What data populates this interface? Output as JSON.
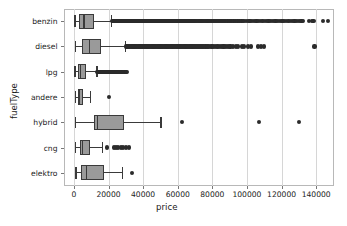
{
  "chart_data": {
    "type": "box",
    "orientation": "horizontal",
    "title": "",
    "xlabel": "price",
    "ylabel": "fuelType",
    "xlim": [
      -6000,
      150000
    ],
    "xticks": [
      0,
      20000,
      40000,
      60000,
      80000,
      100000,
      120000,
      140000
    ],
    "xticklabels": [
      "0",
      "20000",
      "40000",
      "60000",
      "80000",
      "100000",
      "120000",
      "140000"
    ],
    "categories": [
      "benzin",
      "diesel",
      "lpg",
      "andere",
      "hybrid",
      "cng",
      "elektro"
    ],
    "grid": true,
    "grid_axis": "x",
    "legend": null,
    "box_facecolor": "#9a9a9a",
    "box_edgecolor": "#3a3a3a",
    "flier_color": "#2b2b2b",
    "boxes": [
      {
        "category": "benzin",
        "whisker_low": 300,
        "q1": 3000,
        "median": 5900,
        "q3": 11500,
        "whisker_high": 21500,
        "fliers": [
          22000,
          22500,
          23000,
          23400,
          23800,
          24200,
          24600,
          25000,
          25400,
          25800,
          26200,
          26600,
          27000,
          27400,
          27800,
          28200,
          28600,
          29000,
          29400,
          29800,
          30200,
          30600,
          31000,
          31400,
          31800,
          32200,
          32600,
          33000,
          33400,
          33800,
          34200,
          34600,
          35000,
          35400,
          35800,
          36200,
          36600,
          37000,
          37400,
          37800,
          38200,
          38600,
          39000,
          39400,
          39800,
          40200,
          40600,
          41000,
          41400,
          41800,
          42200,
          42600,
          43000,
          43400,
          43800,
          44200,
          44600,
          45000,
          45400,
          45800,
          46200,
          46600,
          47000,
          47400,
          47800,
          48200,
          48600,
          49000,
          49400,
          49800,
          50200,
          50600,
          51000,
          51400,
          51800,
          52200,
          52600,
          53000,
          53400,
          53800,
          54200,
          54600,
          55000,
          55400,
          55800,
          56200,
          56600,
          57000,
          57400,
          57800,
          58200,
          58600,
          59000,
          59400,
          59800,
          60200,
          60600,
          61000,
          61400,
          61800,
          62200,
          62600,
          63000,
          63400,
          63800,
          64200,
          64600,
          65000,
          65400,
          65800,
          66200,
          66600,
          67000,
          67400,
          67800,
          68200,
          68600,
          69000,
          69400,
          69800,
          70200,
          70700,
          71200,
          71700,
          72200,
          72700,
          73200,
          73700,
          74200,
          74700,
          75200,
          75700,
          76200,
          76700,
          77200,
          77700,
          78200,
          78700,
          79200,
          79700,
          80200,
          80800,
          81400,
          82000,
          82600,
          83200,
          83800,
          84400,
          85000,
          85600,
          86200,
          86800,
          87400,
          88000,
          88800,
          89400,
          90000,
          90800,
          91500,
          92200,
          93000,
          93800,
          94500,
          95200,
          96000,
          96800,
          97500,
          98500,
          99500,
          100500,
          101500,
          102500,
          103500,
          104500,
          105500,
          106500,
          107500,
          108500,
          109500,
          110500,
          111500,
          112500,
          113500,
          114500,
          115500,
          116500,
          117500,
          118500,
          119500,
          120500,
          121500,
          122500,
          123500,
          124500,
          125500,
          126500,
          127500,
          128500,
          129500,
          130500,
          131500,
          132500,
          136000,
          137500,
          138500,
          144000,
          147000
        ]
      },
      {
        "category": "diesel",
        "whisker_low": 400,
        "q1": 4700,
        "median": 9200,
        "q3": 15500,
        "whisker_high": 29500,
        "fliers": [
          30000,
          30500,
          31000,
          31500,
          32000,
          32500,
          33000,
          33500,
          34000,
          34500,
          35000,
          35500,
          36000,
          36500,
          37000,
          37500,
          38000,
          38500,
          39000,
          39500,
          40000,
          40500,
          41000,
          41500,
          42000,
          42500,
          43000,
          43500,
          44000,
          44500,
          45000,
          45500,
          46000,
          46500,
          47000,
          47500,
          48000,
          48500,
          49000,
          49500,
          50000,
          50500,
          51000,
          51500,
          52000,
          52500,
          53000,
          53500,
          54000,
          54500,
          55000,
          55500,
          56000,
          56500,
          57000,
          57500,
          58000,
          58500,
          59000,
          59500,
          60000,
          60500,
          61000,
          61500,
          62000,
          62500,
          63000,
          63500,
          64000,
          64500,
          65000,
          65500,
          66000,
          66500,
          67000,
          67500,
          68000,
          68500,
          69000,
          69500,
          70000,
          70600,
          71200,
          71800,
          72400,
          73000,
          73600,
          74200,
          74800,
          75400,
          76000,
          76800,
          77500,
          78200,
          79000,
          79800,
          80500,
          81500,
          82500,
          83500,
          84500,
          85500,
          86500,
          87500,
          88500,
          89500,
          90500,
          92000,
          93500,
          95000,
          97000,
          98500,
          100500,
          102500,
          106500,
          108000,
          110000,
          139000
        ]
      },
      {
        "category": "lpg",
        "whisker_low": 300,
        "q1": 2400,
        "median": 3900,
        "q3": 6900,
        "whisker_high": 13000,
        "fliers": [
          13500,
          14000,
          14400,
          14800,
          15200,
          15600,
          16000,
          16400,
          16800,
          17200,
          17600,
          18000,
          18400,
          18800,
          19200,
          19600,
          20000,
          20400,
          20800,
          21200,
          21600,
          22000,
          22400,
          22800,
          23200,
          23600,
          24000,
          24400,
          24800,
          25200,
          25600,
          26000,
          26500,
          27000,
          27500,
          28000,
          28600,
          29200,
          29800,
          30400
        ]
      },
      {
        "category": "andere",
        "whisker_low": 600,
        "q1": 2200,
        "median": 3400,
        "q3": 5200,
        "whisker_high": 9200,
        "fliers": [
          20500
        ]
      },
      {
        "category": "hybrid",
        "whisker_low": 700,
        "q1": 11800,
        "median": 13800,
        "q3": 28700,
        "whisker_high": 50000,
        "fliers": [
          62500,
          107000,
          130000
        ]
      },
      {
        "category": "cng",
        "whisker_low": 700,
        "q1": 3400,
        "median": 5100,
        "q3": 9400,
        "whisker_high": 16200,
        "fliers": [
          19000,
          23000,
          24500,
          25600,
          27000,
          28500,
          30000,
          32000
        ]
      },
      {
        "category": "elektro",
        "whisker_low": 900,
        "q1": 4200,
        "median": 7400,
        "q3": 17200,
        "whisker_high": 28000,
        "fliers": [
          33500
        ]
      }
    ]
  }
}
